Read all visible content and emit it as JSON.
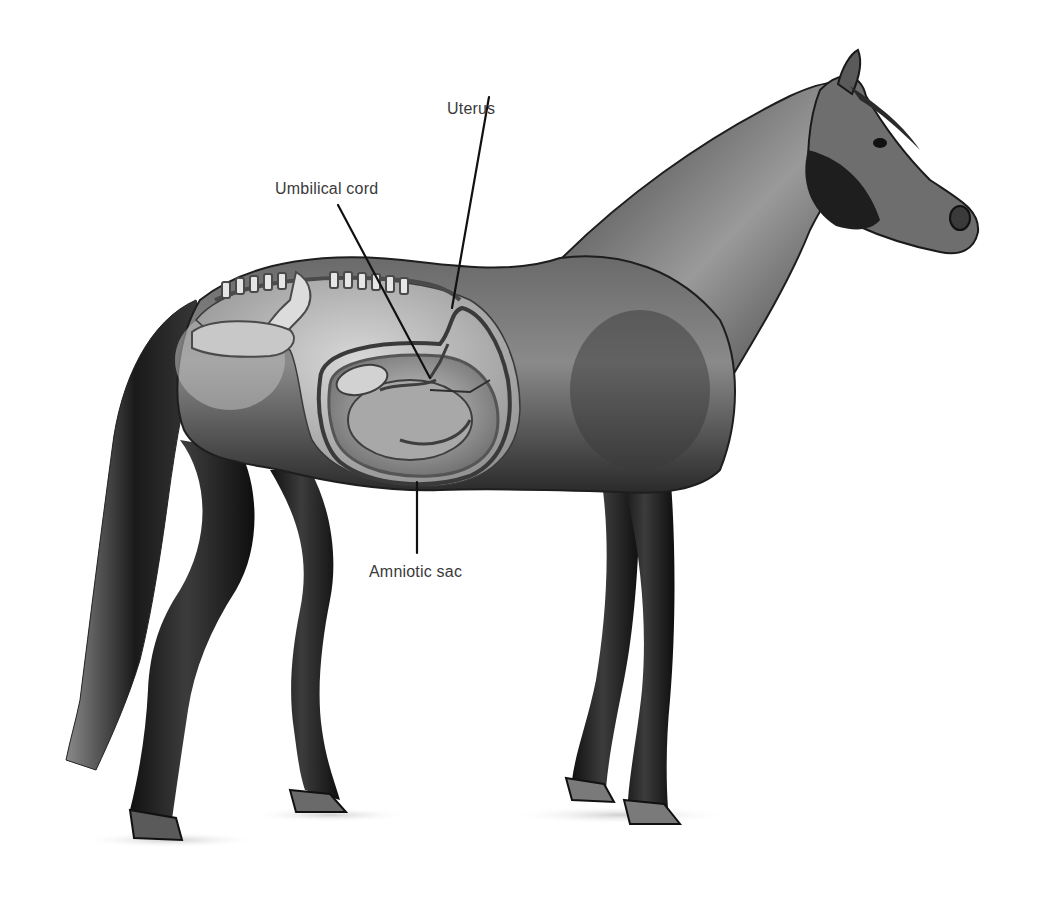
{
  "diagram": {
    "background": "#ffffff",
    "ink_color": "#1a1a1a",
    "label_color": "#3a3a3a",
    "labels": [
      {
        "id": "uterus",
        "text": "Uterus",
        "x": 447,
        "y": 101,
        "line": {
          "x1": 489,
          "y1": 97,
          "x2": 452,
          "y2": 308
        }
      },
      {
        "id": "umbilical-cord",
        "text": "Umbilical cord",
        "x": 275,
        "y": 181,
        "line": {
          "x1": 338,
          "y1": 205,
          "x2": 430,
          "y2": 378
        }
      },
      {
        "id": "amniotic-sac",
        "text": "Amniotic sac",
        "x": 369,
        "y": 564,
        "line": {
          "x1": 417,
          "y1": 482,
          "x2": 417,
          "y2": 553
        }
      }
    ]
  }
}
